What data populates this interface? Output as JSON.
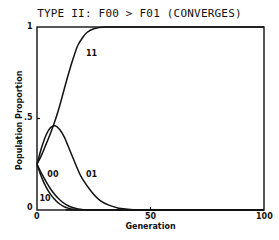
{
  "chart_data": {
    "type": "line",
    "title": "TYPE II:  F00 > F01   (CONVERGES)",
    "xlabel": "Generation",
    "ylabel": "Population Proportion",
    "xlim": [
      0,
      100
    ],
    "ylim": [
      0,
      1
    ],
    "x_ticks": [
      "0",
      "50",
      "100"
    ],
    "y_ticks": [
      "0",
      ".5",
      "1"
    ],
    "grid": false,
    "legend": "inline curve labels",
    "series": [
      {
        "name": "11",
        "x": [
          0,
          2,
          4,
          6,
          8,
          10,
          12,
          14,
          16,
          18,
          20,
          22,
          25,
          30,
          40,
          60,
          100
        ],
        "y": [
          0.25,
          0.3,
          0.36,
          0.42,
          0.49,
          0.57,
          0.66,
          0.75,
          0.83,
          0.9,
          0.94,
          0.97,
          0.99,
          1.0,
          1.0,
          1.0,
          1.0
        ]
      },
      {
        "name": "01",
        "x": [
          0,
          2,
          4,
          6,
          8,
          10,
          12,
          14,
          16,
          18,
          20,
          24,
          28,
          32,
          36,
          40,
          50,
          100
        ],
        "y": [
          0.25,
          0.34,
          0.41,
          0.45,
          0.46,
          0.44,
          0.4,
          0.34,
          0.28,
          0.22,
          0.17,
          0.1,
          0.05,
          0.025,
          0.01,
          0.004,
          0.0,
          0.0
        ]
      },
      {
        "name": "00",
        "x": [
          0,
          2,
          4,
          6,
          8,
          10,
          12,
          14,
          16,
          18,
          20,
          25,
          30,
          100
        ],
        "y": [
          0.25,
          0.2,
          0.155,
          0.115,
          0.082,
          0.056,
          0.036,
          0.022,
          0.012,
          0.006,
          0.003,
          0.0,
          0.0,
          0.0
        ]
      },
      {
        "name": "10",
        "x": [
          0,
          2,
          4,
          6,
          8,
          10,
          12,
          14,
          16,
          20,
          100
        ],
        "y": [
          0.25,
          0.18,
          0.125,
          0.085,
          0.055,
          0.033,
          0.018,
          0.009,
          0.004,
          0.0,
          0.0
        ]
      }
    ],
    "curve_labels": [
      {
        "text": "11",
        "x": 22,
        "y": 0.85
      },
      {
        "text": "01",
        "x": 22,
        "y": 0.19
      },
      {
        "text": "00",
        "x": 5,
        "y": 0.19
      },
      {
        "text": "10",
        "x": 1.5,
        "y": 0.06
      }
    ]
  }
}
